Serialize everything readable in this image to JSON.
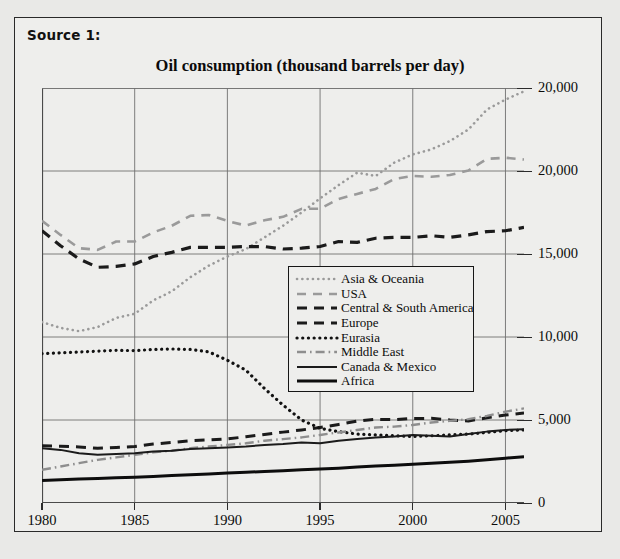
{
  "source": {
    "label": "Source 1:"
  },
  "chart_data": {
    "type": "line",
    "title": "Oil consumption (thousand barrels per day)",
    "xlabel": "",
    "ylabel": "",
    "xlim": [
      1980,
      2006
    ],
    "ylim": [
      0,
      25000
    ],
    "grid": true,
    "legend_position": "center",
    "xticks": [
      1980,
      1985,
      1990,
      1995,
      2000,
      2005
    ],
    "xtick_labels": [
      "1980",
      "1985",
      "1990",
      "1995",
      "2000",
      "2005"
    ],
    "yticks": [
      0,
      5000,
      10000,
      15000,
      20000,
      25000
    ],
    "ytick_labels": [
      "0",
      "5,000",
      "10,000",
      "15,000",
      "20,000",
      "20,000"
    ],
    "x": [
      1980,
      1981,
      1982,
      1983,
      1984,
      1985,
      1986,
      1987,
      1988,
      1989,
      1990,
      1991,
      1992,
      1993,
      1994,
      1995,
      1996,
      1997,
      1998,
      1999,
      2000,
      2001,
      2002,
      2003,
      2004,
      2005,
      2006
    ],
    "series": [
      {
        "name": "Asia & Oceania",
        "style": "dotted",
        "color": "#9a9a9a",
        "width": 2.6,
        "values": [
          10900,
          10550,
          10350,
          10600,
          11150,
          11400,
          12200,
          12750,
          13600,
          14300,
          14850,
          15300,
          16000,
          16700,
          17500,
          18350,
          19150,
          19900,
          19700,
          20500,
          21000,
          21300,
          21800,
          22500,
          23700,
          24300,
          24800
        ]
      },
      {
        "name": "USA",
        "style": "dashed",
        "color": "#9a9a9a",
        "width": 2.6,
        "values": [
          17000,
          16150,
          15350,
          15250,
          15750,
          15750,
          16300,
          16700,
          17300,
          17350,
          16990,
          16710,
          17030,
          17240,
          17720,
          17730,
          18310,
          18620,
          18920,
          19520,
          19700,
          19650,
          19760,
          20030,
          20730,
          20800,
          20690
        ]
      },
      {
        "name": "Central & South America",
        "style": "dashed",
        "color": "#1b1b1b",
        "width": 3.0,
        "values": [
          3450,
          3420,
          3380,
          3300,
          3350,
          3400,
          3550,
          3650,
          3750,
          3800,
          3860,
          3990,
          4130,
          4270,
          4400,
          4550,
          4730,
          4930,
          5040,
          5020,
          5090,
          5100,
          5000,
          4940,
          5130,
          5300,
          5420
        ]
      },
      {
        "name": "Europe",
        "style": "dashed",
        "color": "#1b1b1b",
        "width": 3.2,
        "values": [
          16400,
          15500,
          14700,
          14200,
          14250,
          14400,
          14850,
          15100,
          15400,
          15400,
          15400,
          15450,
          15450,
          15300,
          15350,
          15450,
          15750,
          15700,
          15950,
          16000,
          16000,
          16100,
          16000,
          16150,
          16350,
          16400,
          16600
        ]
      },
      {
        "name": "Eurasia",
        "style": "dotted",
        "color": "#111111",
        "width": 3.2,
        "values": [
          9000,
          9050,
          9100,
          9150,
          9200,
          9180,
          9250,
          9280,
          9250,
          9100,
          8600,
          8000,
          6900,
          5900,
          5000,
          4500,
          4300,
          4150,
          4100,
          4050,
          4000,
          4050,
          4100,
          4150,
          4250,
          4350,
          4400
        ]
      },
      {
        "name": "Middle East",
        "style": "dashdot",
        "color": "#8e8e8e",
        "width": 2.4,
        "values": [
          2000,
          2200,
          2400,
          2600,
          2750,
          2900,
          3050,
          3150,
          3300,
          3400,
          3500,
          3600,
          3750,
          3850,
          3950,
          4100,
          4250,
          4400,
          4550,
          4600,
          4700,
          4850,
          4950,
          5050,
          5250,
          5500,
          5700
        ]
      },
      {
        "name": "Canada & Mexico",
        "style": "solid",
        "color": "#1b1b1b",
        "width": 2.0,
        "values": [
          3300,
          3200,
          3000,
          2900,
          2950,
          3000,
          3100,
          3150,
          3250,
          3300,
          3350,
          3400,
          3500,
          3550,
          3650,
          3600,
          3750,
          3850,
          3950,
          4000,
          4100,
          4050,
          4000,
          4150,
          4300,
          4400,
          4450
        ]
      },
      {
        "name": "Africa",
        "style": "solid",
        "color": "#0d0d0d",
        "width": 3.0,
        "values": [
          1350,
          1400,
          1450,
          1480,
          1520,
          1550,
          1600,
          1650,
          1700,
          1750,
          1800,
          1850,
          1900,
          1950,
          2000,
          2050,
          2100,
          2170,
          2230,
          2280,
          2330,
          2400,
          2450,
          2520,
          2600,
          2700,
          2780
        ]
      }
    ]
  }
}
